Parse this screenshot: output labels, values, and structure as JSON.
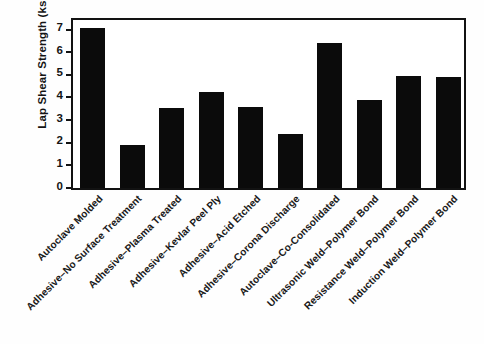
{
  "chart_data": {
    "type": "bar",
    "title": "",
    "xlabel": "",
    "ylabel": "Lap Shear Strength (ksi)",
    "ylim": [
      0,
      7.6
    ],
    "yticks": [
      0,
      1,
      2,
      3,
      4,
      5,
      6,
      7
    ],
    "ytick_labels": [
      "0",
      "1",
      "2",
      "3",
      "4",
      "5",
      "6",
      "7"
    ],
    "grid": false,
    "legend": null,
    "bar_color": "#0b0b0b",
    "frame_color": "#121212",
    "categories": [
      "Autoclave Molded",
      "Adhesive–No Surface Treatment",
      "Adhesive–Plasma Treated",
      "Adhesive–Kevlar Peel Ply",
      "Adhesive–Acid Etched",
      "Adhesive–Corona Discharge",
      "Autoclave–Co-Consolidated",
      "Ultrasonic Weld–Polymer Bond",
      "Resistance Weld–Polymer Bond",
      "Induction Weld–Polymer Bond"
    ],
    "values": [
      7.05,
      1.9,
      3.55,
      4.25,
      3.58,
      2.38,
      6.4,
      3.88,
      4.93,
      4.9
    ]
  }
}
